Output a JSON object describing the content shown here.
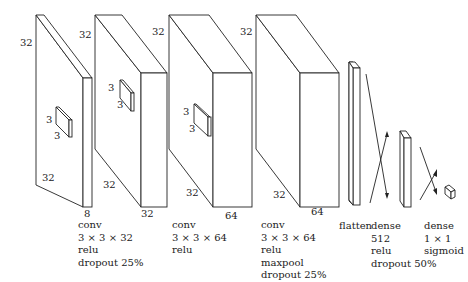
{
  "diagram": {
    "type": "cnn-architecture",
    "layers": [
      {
        "id": "conv1",
        "dims": {
          "height": "32",
          "width": "32",
          "depth": "8"
        },
        "kernel": {
          "h": "3",
          "w": "3"
        },
        "caption": [
          "conv",
          "3 × 3 × 32",
          "relu",
          "dropout 25%"
        ]
      },
      {
        "id": "conv2",
        "dims": {
          "height": "32",
          "width": "32",
          "depth": "32"
        },
        "kernel": {
          "h": "3",
          "w": "3"
        },
        "caption": [
          "conv",
          "3 × 3 × 64",
          "relu"
        ]
      },
      {
        "id": "conv3",
        "dims": {
          "height": "32",
          "width": "32",
          "depth": "64"
        },
        "kernel": {
          "h": "3",
          "w": "3"
        },
        "caption": [
          "conv",
          "3 × 3 × 64",
          "relu",
          "maxpool",
          "dropout 25%"
        ]
      },
      {
        "id": "pool",
        "dims": {
          "height": "32",
          "width": "32",
          "depth": "64"
        }
      },
      {
        "id": "flatten",
        "caption": [
          "flatten"
        ]
      },
      {
        "id": "dense1",
        "caption": [
          "dense",
          "512",
          "relu",
          "dropout 50%"
        ]
      },
      {
        "id": "dense2",
        "caption": [
          "dense",
          "1 × 1",
          "sigmoid"
        ]
      }
    ],
    "labels": {
      "l1_h": "32",
      "l1_w": "32",
      "l1_d": "8",
      "l1_k1": "3",
      "l1_k2": "3",
      "l2_h": "32",
      "l2_w": "32",
      "l2_d": "32",
      "l2_k1": "3",
      "l2_k2": "3",
      "l3_h": "32",
      "l3_w": "32",
      "l3_d": "64",
      "l3_k1": "3",
      "l3_k2": "3",
      "l4_h": "32",
      "l4_w": "32",
      "l4_d": "64"
    },
    "captions": {
      "conv1": [
        "conv",
        "3 × 3 × 32",
        "relu",
        "dropout 25%"
      ],
      "conv2": [
        "conv",
        "3 × 3 × 64",
        "relu"
      ],
      "conv3": [
        "conv",
        "3 × 3 × 64",
        "relu",
        "maxpool",
        "dropout 25%"
      ],
      "flatten": "flatten",
      "dense1": [
        "dense",
        "512",
        "relu",
        "dropout 50%"
      ],
      "dense2": [
        "dense",
        "1 × 1",
        "sigmoid"
      ]
    }
  }
}
